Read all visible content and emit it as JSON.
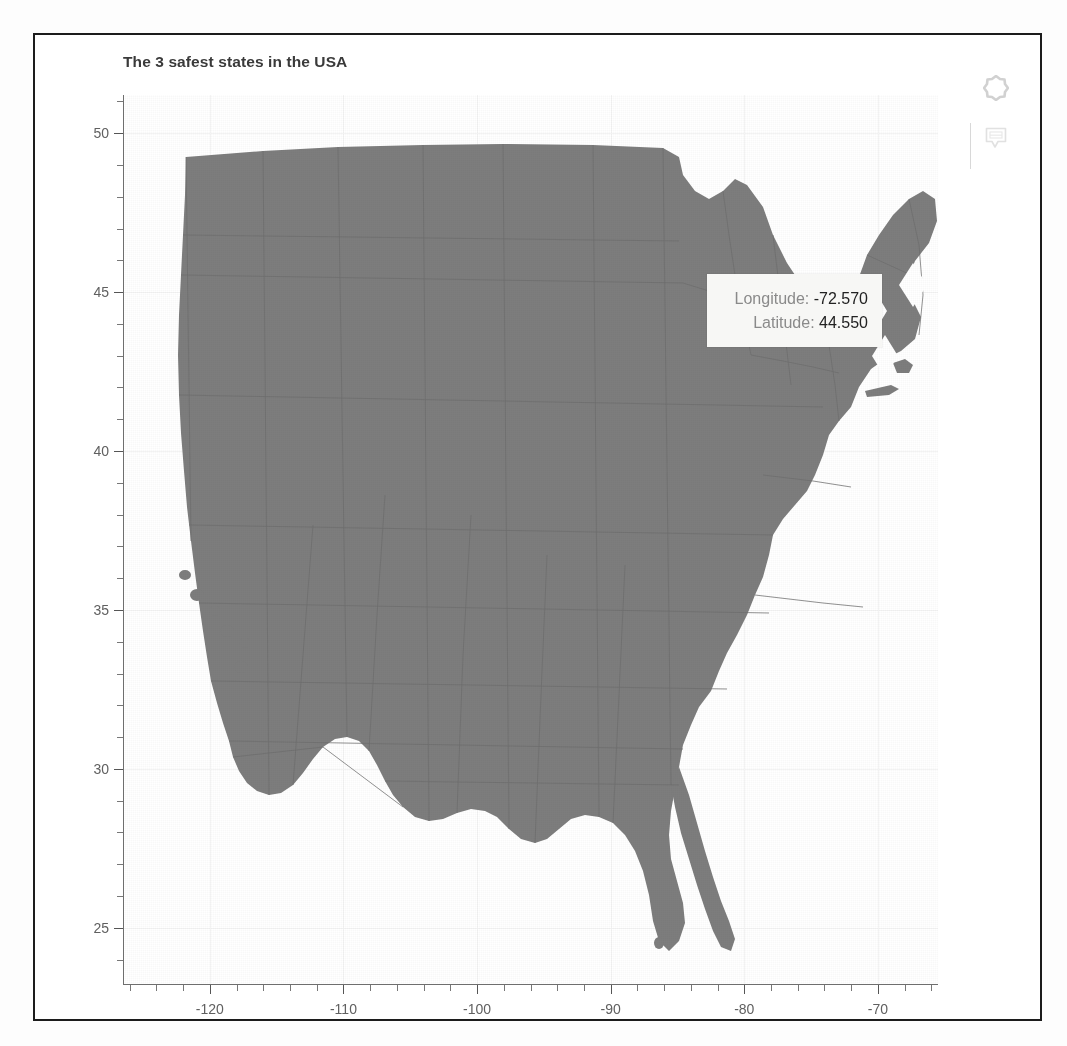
{
  "chart_data": {
    "type": "scatter",
    "title": "The 3 safest states in the USA",
    "xlabel": "",
    "ylabel": "",
    "xlim": [
      -126.5,
      -65.5
    ],
    "ylim": [
      23.2,
      51.2
    ],
    "grid": true,
    "legend": "none",
    "x_ticks": [
      "-120",
      "-110",
      "-100",
      "-90",
      "-80",
      "-70"
    ],
    "x_tick_values": [
      -120,
      -110,
      -100,
      -90,
      -80,
      -70
    ],
    "y_ticks": [
      "50",
      "45",
      "40",
      "35",
      "30",
      "25"
    ],
    "y_tick_values": [
      50,
      45,
      40,
      35,
      30,
      25
    ],
    "x_minor_step": 2,
    "y_minor_step": 1,
    "base_layer": "United States state map (contiguous 48), gray landmass with state boundaries",
    "series": [
      {
        "name": "3 safest states",
        "marker": "diamond",
        "marker_color": "#ffffff",
        "points": [
          {
            "label": "Maine",
            "longitude": -69.23,
            "latitude": 45.37
          },
          {
            "label": "Vermont",
            "longitude": -72.57,
            "latitude": 44.55
          },
          {
            "label": "New Hampshire",
            "longitude": -71.57,
            "latitude": 43.19
          }
        ]
      }
    ]
  },
  "tooltip": {
    "longitude_label": "Longitude:",
    "longitude_value": "-72.570",
    "latitude_label": "Latitude:",
    "latitude_value": "44.550"
  },
  "modebar": {
    "buttons": [
      {
        "name": "plotly-logo-icon",
        "title": "Produced with Plotly"
      },
      {
        "name": "comment-icon",
        "title": "Feedback"
      }
    ]
  },
  "colors": {
    "land": "#7d7d7d",
    "marker": "#ffffff",
    "axis": "#6e6e6e",
    "title": "#3a3a3a",
    "tooltip_bg": "#f7f7f5",
    "frame": "#1c1c1c"
  }
}
